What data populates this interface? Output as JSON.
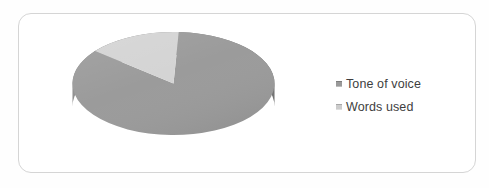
{
  "card": {
    "background": "#ffffff",
    "border_color": "#d5d5d5"
  },
  "chart_data": {
    "type": "pie",
    "style": "3d",
    "title": "",
    "categories": [
      "Tone of voice",
      "Words used"
    ],
    "values": [
      85,
      15
    ],
    "values_are_percent_estimates": true,
    "colors": [
      "#9b9b9b",
      "#d4d4d4"
    ],
    "side_color": "#868686",
    "start_angle_deg": 87,
    "clockwise": true,
    "legend": {
      "position": "right",
      "marker_colors": [
        "#9a9a9a",
        "#cccccc"
      ]
    }
  }
}
